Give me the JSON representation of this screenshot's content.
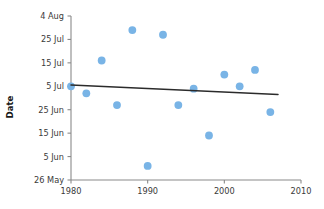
{
  "chart_data": {
    "type": "scatter",
    "title": "",
    "xlabel": "",
    "ylabel": "Date",
    "xlim": [
      1980,
      2010
    ],
    "ylim_labels": [
      "26 May",
      "4 Aug"
    ],
    "grid": false,
    "legend": false,
    "x_ticks": [
      "1980",
      "1990",
      "2000",
      "2010"
    ],
    "x_tick_values": [
      1980,
      1990,
      2000,
      2010
    ],
    "y_ticks": [
      "4 Aug",
      "25 Jul",
      "15 Jul",
      "5 Jul",
      "25 Jun",
      "15 Jun",
      "5 Jun",
      "26 May"
    ],
    "y_tick_daynumbers": [
      216,
      206,
      196,
      186,
      176,
      166,
      156,
      146
    ],
    "point_color": "#79b4e6",
    "trendline_color": "#2b2b2b",
    "axis_color": "#8a8a8a",
    "series": [
      {
        "name": "Observations",
        "points": [
          {
            "x": 1980,
            "y": 186,
            "label": "5 Jul"
          },
          {
            "x": 1982,
            "y": 183,
            "label": "2 Jul"
          },
          {
            "x": 1984,
            "y": 197,
            "label": "16 Jul"
          },
          {
            "x": 1986,
            "y": 178,
            "label": "27 Jun"
          },
          {
            "x": 1988,
            "y": 210,
            "label": "29 Jul"
          },
          {
            "x": 1990,
            "y": 152,
            "label": "1 Jun"
          },
          {
            "x": 1992,
            "y": 208,
            "label": "27 Jul"
          },
          {
            "x": 1994,
            "y": 178,
            "label": "27 Jun"
          },
          {
            "x": 1996,
            "y": 185,
            "label": "4 Jul"
          },
          {
            "x": 1998,
            "y": 165,
            "label": "14 Jun"
          },
          {
            "x": 2000,
            "y": 191,
            "label": "10 Jul"
          },
          {
            "x": 2002,
            "y": 186,
            "label": "5 Jul"
          },
          {
            "x": 2004,
            "y": 193,
            "label": "12 Jul"
          },
          {
            "x": 2006,
            "y": 175,
            "label": "24 Jun"
          }
        ]
      }
    ],
    "trendline": {
      "name": "Linear fit",
      "x_start": 1980,
      "y_start": 186.5,
      "x_end": 2007,
      "y_end": 182.5
    }
  }
}
